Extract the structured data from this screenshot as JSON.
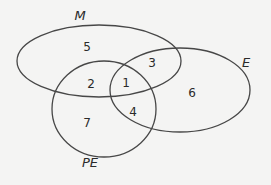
{
  "diagram": {
    "type": "venn",
    "stroke_color": "#474747",
    "background_color": "#f4f4f3",
    "sets": [
      {
        "id": "M",
        "label": "M",
        "cx": 99,
        "cy": 61,
        "rx": 82,
        "ry": 36,
        "label_x": 80,
        "label_y": 20
      },
      {
        "id": "E",
        "label": "E",
        "cx": 180,
        "cy": 90,
        "rx": 70,
        "ry": 42,
        "label_x": 246,
        "label_y": 67
      },
      {
        "id": "PE",
        "label": "PE",
        "cx": 104,
        "cy": 109,
        "rx": 52,
        "ry": 48,
        "label_x": 90,
        "label_y": 167
      }
    ],
    "regions": [
      {
        "membership": "M only",
        "value": "5",
        "x": 87,
        "y": 51
      },
      {
        "membership": "M ∩ E only",
        "value": "3",
        "x": 152,
        "y": 67
      },
      {
        "membership": "M ∩ PE only",
        "value": "2",
        "x": 91,
        "y": 88
      },
      {
        "membership": "M ∩ E ∩ PE",
        "value": "1",
        "x": 126,
        "y": 87
      },
      {
        "membership": "E only",
        "value": "6",
        "x": 192,
        "y": 97
      },
      {
        "membership": "E ∩ PE only",
        "value": "4",
        "x": 133,
        "y": 116
      },
      {
        "membership": "PE only",
        "value": "7",
        "x": 87,
        "y": 127
      }
    ]
  }
}
